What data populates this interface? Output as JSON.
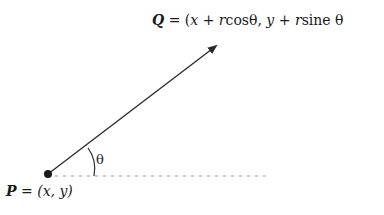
{
  "diagram": {
    "point_q": {
      "name": "Q",
      "eq": "=",
      "expr_open": "(",
      "x": "x",
      "plus1": "+",
      "r1": "r",
      "cos": "cosθ,",
      "y": "y",
      "plus2": "+",
      "r2": "r",
      "sine": "sine θ"
    },
    "point_p": {
      "name": "P",
      "eq": "=",
      "expr": "(x, y)"
    },
    "angle_label": "θ",
    "colors": {
      "line": "#2a2a2a",
      "dotted": "#9a9a9a",
      "point": "#1a1a1a"
    }
  }
}
